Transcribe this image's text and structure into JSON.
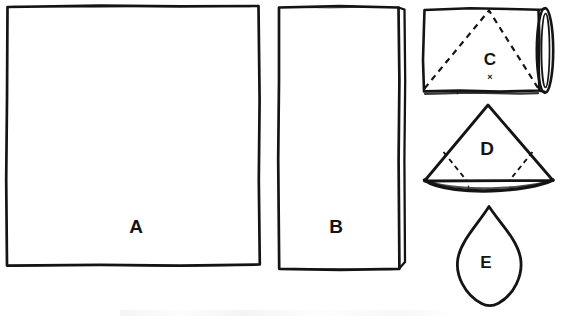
{
  "figure": {
    "type": "line-drawing",
    "background_color": "#ffffff",
    "ink_color": "#141414",
    "width": 571,
    "height": 321,
    "shape_count": 5
  },
  "shapes": [
    {
      "id": "A",
      "label": "A",
      "form": "large-square-rectangle",
      "description": "Large hand-drawn square outline",
      "x": 6,
      "y": 6,
      "width": 254,
      "height": 260,
      "label_x": 136,
      "label_y": 228,
      "label_size": 19
    },
    {
      "id": "B",
      "label": "B",
      "form": "tall-rectangle-with-rolled-edge",
      "description": "Tall narrow rectangle with a doubled right edge",
      "x": 277,
      "y": 6,
      "width": 128,
      "height": 264,
      "label_x": 336,
      "label_y": 228,
      "label_size": 19
    },
    {
      "id": "C",
      "label": "C",
      "form": "rectangle-rolled-cylinder-with-dashed-triangle",
      "description": "Rectangle rolled into a cylinder at right, dashed triangle inscribed, small x mark at base",
      "x": 421,
      "y": 8,
      "width": 123,
      "height": 85,
      "label_x": 490,
      "label_y": 61,
      "label_size": 17,
      "mark": "×",
      "mark_x": 490,
      "mark_y": 78
    },
    {
      "id": "D",
      "label": "D",
      "form": "triangle-cone-with-dashed-folds",
      "description": "Triangle with thick elliptical base and two dashed fold lines",
      "apex_x": 488,
      "apex_y": 105,
      "base_left_x": 424,
      "base_right_x": 553,
      "base_y": 182,
      "label_x": 487,
      "label_y": 150,
      "label_size": 19
    },
    {
      "id": "E",
      "label": "E",
      "form": "pointed-oval-cone",
      "description": "Teardrop / pointed oval, apex at top, rounded at bottom",
      "apex_x": 489,
      "apex_y": 206,
      "bottom_y": 305,
      "left_x": 457,
      "right_x": 521,
      "label_x": 486,
      "label_y": 264,
      "label_size": 17
    }
  ]
}
